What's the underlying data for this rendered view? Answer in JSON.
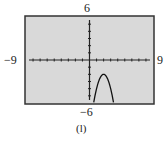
{
  "chart_data": {
    "type": "line",
    "title": "",
    "caption": "(l)",
    "xlabel": "",
    "ylabel": "",
    "xlim": [
      -9,
      9
    ],
    "ylim": [
      -6,
      6
    ],
    "xscale": 1,
    "yscale": 1,
    "grid": false,
    "tick_labels": {
      "xmin": "−9",
      "xmax": "9",
      "ymin": "−6",
      "ymax": "6"
    },
    "series": [
      {
        "name": "f(x)",
        "approx_equation": "y = -2(x-2)^2 - 2",
        "x": [
          0.6,
          1.0,
          1.4,
          1.8,
          2.0,
          2.2,
          2.6,
          3.0,
          3.4
        ],
        "y": [
          -5.9,
          -4.0,
          -2.7,
          -2.1,
          -2.0,
          -2.1,
          -2.7,
          -4.0,
          -5.9
        ]
      }
    ]
  },
  "colors": {
    "screen_bg": "#d9d9d9",
    "frame": "#333333",
    "axis": "#222222",
    "curve": "#111111"
  }
}
